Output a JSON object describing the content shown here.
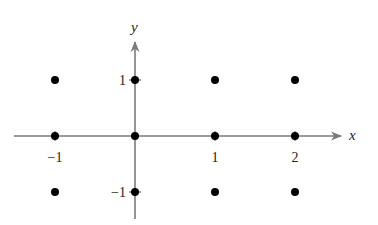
{
  "chart_data": {
    "type": "scatter",
    "title": "",
    "xlabel": "x",
    "ylabel": "y",
    "x_ticks": [
      -1,
      1,
      2
    ],
    "y_ticks": [
      1,
      -1
    ],
    "x_tick_labels": [
      "−1",
      "1",
      "2"
    ],
    "y_tick_labels": [
      "1",
      "−1"
    ],
    "xlim": [
      -1.5,
      2.6
    ],
    "ylim": [
      -1.5,
      1.7
    ],
    "grid": false,
    "legend": null,
    "series": [
      {
        "name": "lattice points",
        "points": [
          {
            "x": -1,
            "y": 1
          },
          {
            "x": 0,
            "y": 1
          },
          {
            "x": 1,
            "y": 1
          },
          {
            "x": 2,
            "y": 1
          },
          {
            "x": -1,
            "y": 0
          },
          {
            "x": 0,
            "y": 0
          },
          {
            "x": 1,
            "y": 0
          },
          {
            "x": 2,
            "y": 0
          },
          {
            "x": -1,
            "y": -1
          },
          {
            "x": 0,
            "y": -1
          },
          {
            "x": 1,
            "y": -1
          },
          {
            "x": 2,
            "y": -1
          }
        ]
      }
    ]
  },
  "colors": {
    "axis": "#7a7a7a",
    "point": "#000000",
    "text": "#222222"
  },
  "layout": {
    "origin_px": [
      135,
      136
    ],
    "unit_x_px": 80,
    "unit_y_px": 56,
    "x_axis_range_px": [
      14,
      341
    ],
    "y_axis_range_px": [
      42,
      219
    ]
  }
}
